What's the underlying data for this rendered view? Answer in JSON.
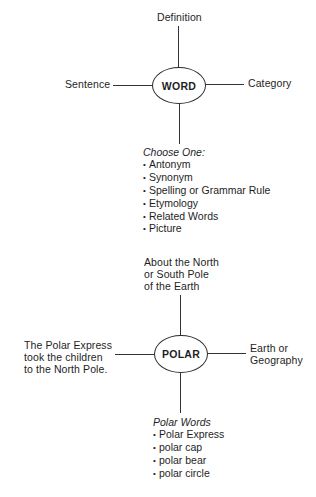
{
  "word_map": {
    "center": "WORD",
    "top": "Definition",
    "left": "Sentence",
    "right": "Category",
    "list": {
      "heading": "Choose One:",
      "items": [
        "Antonym",
        "Synonym",
        "Spelling or Grammar Rule",
        "Etymology",
        "Related Words",
        "Picture"
      ]
    }
  },
  "polar_map": {
    "center": "POLAR",
    "top": [
      "About the North",
      "or South Pole",
      "of the Earth"
    ],
    "left": [
      "The Polar Express",
      "took the children",
      "to the North Pole."
    ],
    "right": [
      "Earth or",
      "Geography"
    ],
    "list": {
      "heading": "Polar Words",
      "items": [
        "Polar Express",
        "polar cap",
        "polar bear",
        "polar circle"
      ]
    }
  }
}
